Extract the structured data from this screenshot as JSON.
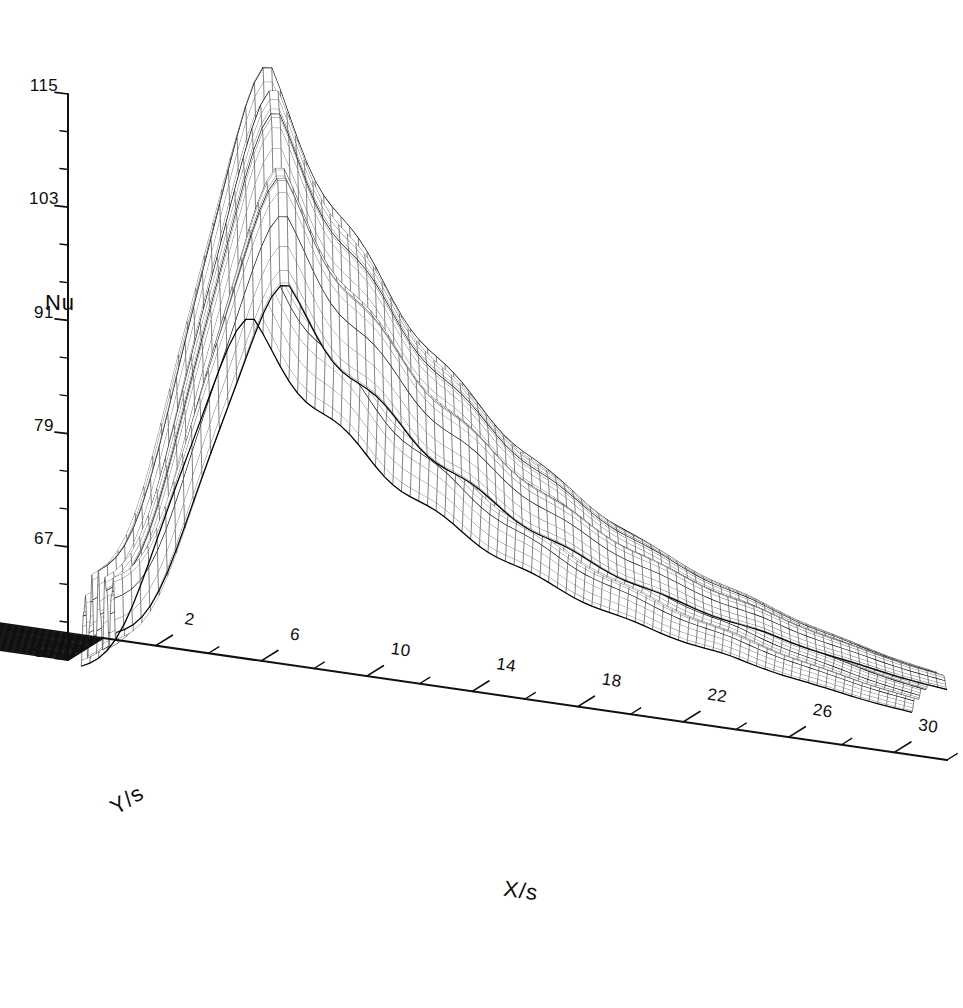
{
  "figure": {
    "kind": "3d-wireframe-surface",
    "background_color": "#ffffff",
    "line_color": "#1a1a1a"
  },
  "chart_data": {
    "type": "surface",
    "title": "",
    "subtitle": "",
    "xlabel": "X/s",
    "ylabel": "Y/s",
    "zlabel": "Nu",
    "xlim": [
      0,
      32
    ],
    "ylim": [
      -13,
      13
    ],
    "zlim": [
      55,
      115
    ],
    "xticks": [
      2,
      6,
      10,
      14,
      18,
      22,
      26,
      30
    ],
    "xtick_labels": [
      "2",
      "6",
      "10",
      "14",
      "18",
      "22",
      "26",
      "30"
    ],
    "xtick_minor_step": 2,
    "yticks": [
      13,
      11,
      9,
      7,
      5,
      3,
      1,
      -1,
      -3,
      -5,
      -7,
      -9,
      -11,
      -13
    ],
    "ytick_labels": [
      "13",
      "11",
      "9",
      "7",
      "5",
      "3",
      "1",
      "-1",
      "-3",
      "-5",
      "-7",
      "-9",
      "-11",
      "-13"
    ],
    "ytick_minor_step": 1,
    "zticks": [
      55,
      67,
      79,
      91,
      103,
      115
    ],
    "ztick_labels": [
      "55",
      "67",
      "79",
      "91",
      "103",
      "115"
    ],
    "ztick_minor_step": 4,
    "grid": false,
    "legend": false,
    "mesh": {
      "nx": 96,
      "ny": 72,
      "bold_every_y": 4,
      "x_start": 0.5,
      "x_end": 32.0,
      "y_start": -13.0,
      "y_end": 13.0
    },
    "surface_model": {
      "description": "Nusselt number distribution downstream of a backward-facing step: sharp streamwise peak near x~7 with ridged spanwise structure, monotonic decay downstream, gentle spanwise modulation.",
      "z_base": 56.0,
      "peak_z": 114.0,
      "peak_x": 7.0,
      "rise_width": 5.2,
      "decay_length": 13.0,
      "tail_z": 62.0,
      "spanwise_amp": 3.4,
      "spanwise_period": 5.2,
      "ripple_amp": 1.6,
      "ripple_period": 2.3,
      "edge_rolloff": 0.22
    },
    "projection": {
      "origin_px": [
        103,
        638
      ],
      "x_axis_end_px": [
        947,
        760
      ],
      "y_axis_end_px": [
        68,
        660
      ],
      "z_axis_top_px": [
        103,
        72
      ],
      "elevation_deg": 26,
      "azimuth_deg": 42
    }
  },
  "axes": {
    "x": {
      "title": "X/s",
      "title_pos_px": [
        520,
        898
      ]
    },
    "y": {
      "title": "Y/s",
      "title_pos_px": [
        131,
        806
      ]
    },
    "z": {
      "title": "Nu",
      "title_pos_px": [
        60,
        310
      ]
    }
  }
}
